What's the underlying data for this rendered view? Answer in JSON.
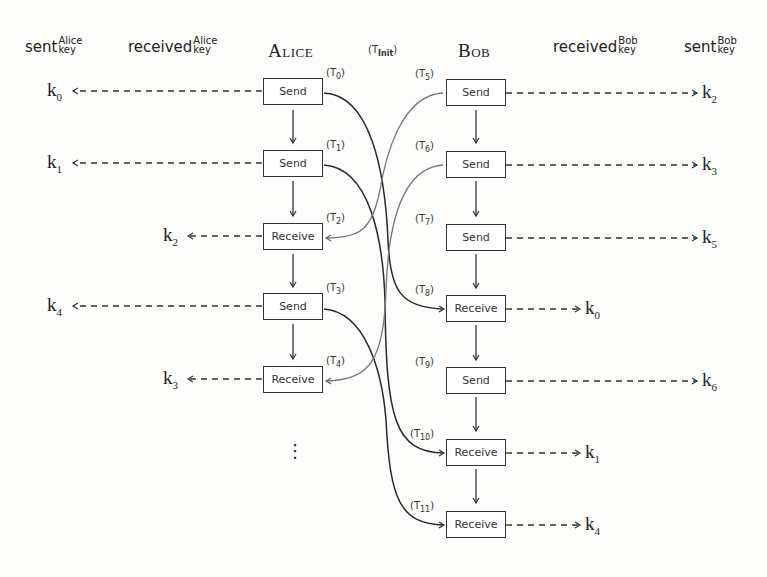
{
  "diagram": {
    "type": "protocol-flow",
    "headers": {
      "alice_sent": {
        "base": "sent",
        "sup": "Alice",
        "sub": "key"
      },
      "alice_received": {
        "base": "received",
        "sup": "Alice",
        "sub": "key"
      },
      "alice": "Alice",
      "t_init": "(T",
      "t_init_sub": "Init",
      "t_init_close": ")",
      "bob": "Bob",
      "bob_received": {
        "base": "received",
        "sup": "Bob",
        "sub": "key"
      },
      "bob_sent": {
        "base": "sent",
        "sup": "Bob",
        "sub": "key"
      }
    },
    "alice_steps": [
      {
        "label": "Send",
        "tag": "0",
        "key": "0",
        "key_column": "sent"
      },
      {
        "label": "Send",
        "tag": "1",
        "key": "1",
        "key_column": "sent"
      },
      {
        "label": "Receive",
        "tag": "2",
        "key": "2",
        "key_column": "received"
      },
      {
        "label": "Send",
        "tag": "3",
        "key": "4",
        "key_column": "sent"
      },
      {
        "label": "Receive",
        "tag": "4",
        "key": "3",
        "key_column": "received"
      }
    ],
    "alice_ellipsis": "⋮",
    "bob_steps": [
      {
        "label": "Send",
        "tag": "5",
        "key": "2",
        "key_column": "sent"
      },
      {
        "label": "Send",
        "tag": "6",
        "key": "3",
        "key_column": "sent"
      },
      {
        "label": "Send",
        "tag": "7",
        "key": "5",
        "key_column": "sent"
      },
      {
        "label": "Receive",
        "tag": "8",
        "key": "0",
        "key_column": "received"
      },
      {
        "label": "Send",
        "tag": "9",
        "key": "6",
        "key_column": "sent"
      },
      {
        "label": "Receive",
        "tag": "10",
        "key": "1",
        "key_column": "received"
      },
      {
        "label": "Receive",
        "tag": "11",
        "key": "4",
        "key_column": "received"
      }
    ],
    "messages": [
      {
        "from": "T0",
        "to": "T8"
      },
      {
        "from": "T1",
        "to": "T10"
      },
      {
        "from": "T3",
        "to": "T11"
      },
      {
        "from": "T5",
        "to": "T2"
      },
      {
        "from": "T6",
        "to": "T4"
      }
    ],
    "key_prefix": "k",
    "tag_prefix": "(T",
    "tag_suffix": ")"
  }
}
